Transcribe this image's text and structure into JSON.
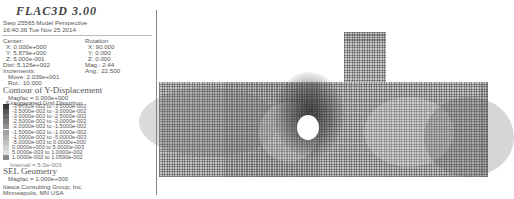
{
  "header": {
    "title": "FLAC3D 3.00",
    "step_line": "Step 25565  Model Perspective",
    "timestamp": "16:40:36 Tue Nov 25 2014"
  },
  "view": {
    "center_label": "Center:",
    "center_x": "X: 0.000e+000",
    "center_y": "Y: 5.879e+000",
    "center_z": "Z: 5.000e-001",
    "rotation_label": "Rotation:",
    "rotation_x": "X:  90.000",
    "rotation_y": "Y:   0.000",
    "rotation_z": "Z:   0.000",
    "dist": "Dist: 5.126e+002",
    "mag": "Mag.:      2.44",
    "increments_label": "Increments:",
    "ang": "Ang.:  22.500",
    "move": "Move: 2.039e+001",
    "rot": "Rot.:   10.000"
  },
  "contour": {
    "title": "Contour of Y-Displacement",
    "magfac": "Magfac = 0.000e+000",
    "distortion": "Exaggerated Grid Distortion",
    "legend": [
      {
        "label": "-3.6782e-002 to -3.5000e-002",
        "color": "#3a3a3a"
      },
      {
        "label": "-3.5000e-002 to -3.0000e-002",
        "color": "#555555"
      },
      {
        "label": "-3.0000e-002 to -2.5000e-002",
        "color": "#6a6a6a"
      },
      {
        "label": "-2.5000e-002 to -2.0000e-002",
        "color": "#7e7e7e"
      },
      {
        "label": "-2.0000e-002 to -1.5000e-002",
        "color": "#909090"
      },
      {
        "label": "-1.5000e-002 to -1.0000e-002",
        "color": "#a0a0a0"
      },
      {
        "label": "-1.0000e-002 to -5.0000e-003",
        "color": "#b0b0b0"
      },
      {
        "label": "-5.0000e-003 to  0.0000e+000",
        "color": "#c0c0c0"
      },
      {
        "label": " 0.0000e+000 to  5.0000e-003",
        "color": "#d0d0d0"
      },
      {
        "label": " 5.0000e-003 to  1.0000e-002",
        "color": "#dedede"
      },
      {
        "label": " 1.0000e-002 to  1.0590e-002",
        "color": "#8a8a8a"
      }
    ],
    "interval": "Interval = 5.0e-003"
  },
  "geometry": {
    "title": "SEL Geometry",
    "magfac": "Magfac = 1.000e+000"
  },
  "footer": {
    "company": "Itasca Consulting Group, Inc.",
    "location": "Minneapolis, MN  USA"
  }
}
